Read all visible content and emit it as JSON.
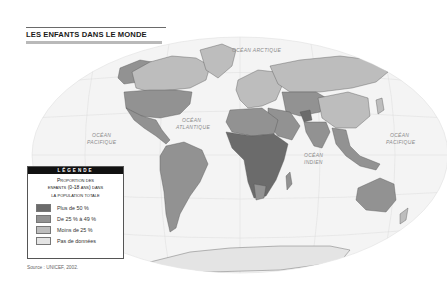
{
  "title": "LES ENFANTS DANS LE MONDE",
  "oceans": {
    "arctic": "OCÉAN ARCTIQUE",
    "atlantic_1": "OCÉAN",
    "atlantic_2": "ATLANTIQUE",
    "pacific_west_1": "OCÉAN",
    "pacific_west_2": "PACIFIQUE",
    "pacific_east_1": "OCÉAN",
    "pacific_east_2": "PACIFIQUE",
    "indian_1": "OCÉAN",
    "indian_2": "INDIEN"
  },
  "legend": {
    "header": "LÉGENDE",
    "title_line1": "Proportion des",
    "title_line2": "enfants (0-18 ans) dans",
    "title_line3": "la population totale",
    "items": [
      {
        "label": "Plus de 50 %",
        "color": "#6b6b6b"
      },
      {
        "label": "De 25 % à 49 %",
        "color": "#929292"
      },
      {
        "label": "Moins de 25 %",
        "color": "#bdbdbd"
      },
      {
        "label": "Pas de données",
        "color": "#e4e4e4"
      }
    ]
  },
  "colors": {
    "high": "#6b6b6b",
    "mid": "#929292",
    "low": "#bdbdbd",
    "nodata": "#e4e4e4",
    "ocean": "#f3f3f3",
    "graticule": "#dedede"
  },
  "source": "Source : UNICEF, 2002."
}
